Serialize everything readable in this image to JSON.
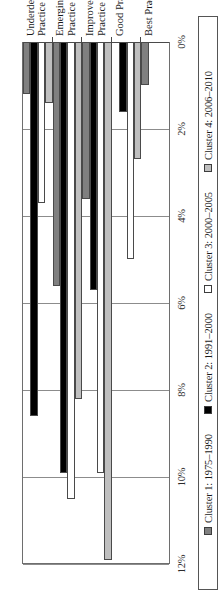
{
  "chart_data": {
    "type": "bar",
    "orientation": "horizontal",
    "title": "",
    "subtitle": "",
    "xlabel": "",
    "ylabel": "",
    "categories": [
      "Underdeveloped Practice",
      "Emerging Practice",
      "Improved Practice",
      "Good Practice",
      "Best Practice"
    ],
    "category_lines": [
      [
        "Underdeveloped",
        "Practice"
      ],
      [
        "Emerging",
        "Practice"
      ],
      [
        "Improved",
        "Practice"
      ],
      [
        "Good Practice"
      ],
      [
        "Best Practice"
      ]
    ],
    "series": [
      {
        "name": "Cluster 1: 1975–1990",
        "color": "#808080",
        "values": [
          1.2,
          5.6,
          3.6,
          0.0,
          1.0
        ]
      },
      {
        "name": "Cluster 2: 1991–2000",
        "color": "#000000",
        "values": [
          8.6,
          9.9,
          5.7,
          1.6,
          0.0
        ]
      },
      {
        "name": "Cluster 3: 2000–2005",
        "color": "#ffffff",
        "values": [
          3.7,
          10.5,
          9.9,
          5.0,
          0.0
        ]
      },
      {
        "name": "Cluster 4: 2006–2010",
        "color": "#bfbfbf",
        "values": [
          1.4,
          8.2,
          11.9,
          2.7,
          0.0
        ]
      }
    ],
    "value_axis": {
      "min": 0,
      "max": 12,
      "ticks": [
        0,
        2,
        4,
        6,
        8,
        10,
        12
      ],
      "tick_labels": [
        "0%",
        "2%",
        "4%",
        "6%",
        "8%",
        "10%",
        "12%"
      ]
    },
    "grid": true,
    "legend_position": "bottom"
  },
  "legend": {
    "items": [
      {
        "label": "Cluster 1: 1975–1990",
        "swatch": "c1"
      },
      {
        "label": "Cluster 2: 1991–2000",
        "swatch": "c2"
      },
      {
        "label": "Cluster 3: 2000–2005",
        "swatch": "c3"
      },
      {
        "label": "Cluster 4: 2006–2010",
        "swatch": "c4"
      }
    ]
  }
}
